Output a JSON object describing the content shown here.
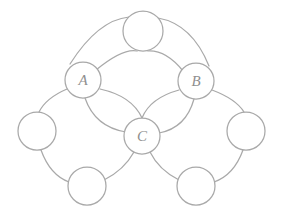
{
  "figure": {
    "name": "graph-diagram",
    "title": "",
    "background_color": "#ffffff",
    "stroke_color": "#a9a9a9",
    "label_color": "#8f8f8f",
    "width": 284,
    "height": 218
  },
  "graph_data": {
    "type": "diagram",
    "description": "Undirected multigraph drawn with circular vertices and arc edges; three vertices are labelled A, B and C, the remaining five are unlabelled.",
    "node_count": 8,
    "edge_count": 14,
    "nodes": [
      {
        "id": "top",
        "label": "",
        "cx": 143,
        "cy": 31,
        "r": 20
      },
      {
        "id": "A",
        "label": "A",
        "cx": 83,
        "cy": 80,
        "r": 18
      },
      {
        "id": "B",
        "label": "B",
        "cx": 196,
        "cy": 81,
        "r": 18
      },
      {
        "id": "left",
        "label": "",
        "cx": 37,
        "cy": 131,
        "r": 19
      },
      {
        "id": "C",
        "label": "C",
        "cx": 142,
        "cy": 136,
        "r": 18
      },
      {
        "id": "right",
        "label": "",
        "cx": 246,
        "cy": 131,
        "r": 19
      },
      {
        "id": "bottom_left",
        "label": "",
        "cx": 87,
        "cy": 186,
        "r": 19
      },
      {
        "id": "bottom_right",
        "label": "",
        "cx": 196,
        "cy": 186,
        "r": 19
      }
    ],
    "edges": [
      {
        "from": "A",
        "to": "top",
        "multiplicity": 2,
        "style": "arc"
      },
      {
        "from": "top",
        "to": "B",
        "multiplicity": 2,
        "style": "arc"
      },
      {
        "from": "A",
        "to": "C",
        "multiplicity": 2,
        "style": "arc"
      },
      {
        "from": "B",
        "to": "C",
        "multiplicity": 2,
        "style": "arc"
      },
      {
        "from": "A",
        "to": "left",
        "multiplicity": 1,
        "style": "arc"
      },
      {
        "from": "left",
        "to": "bottom_left",
        "multiplicity": 1,
        "style": "arc"
      },
      {
        "from": "bottom_left",
        "to": "C",
        "multiplicity": 1,
        "style": "arc"
      },
      {
        "from": "B",
        "to": "right",
        "multiplicity": 1,
        "style": "arc"
      },
      {
        "from": "right",
        "to": "bottom_right",
        "multiplicity": 1,
        "style": "arc"
      },
      {
        "from": "bottom_right",
        "to": "C",
        "multiplicity": 1,
        "style": "arc"
      }
    ],
    "labels": {
      "a": "A",
      "b": "B",
      "c": "C"
    }
  }
}
